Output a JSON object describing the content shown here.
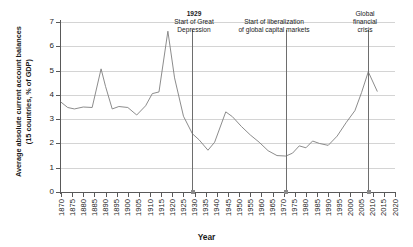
{
  "chart_data": {
    "type": "line",
    "title": "",
    "xlabel": "Year",
    "ylabel": "Average absolute current account balances (15 countries, % of GDP)",
    "ylabel_line1": "Average absolute current account balances",
    "ylabel_line2": "(15 countries, % of GDP)",
    "xlim": [
      1870,
      2020
    ],
    "ylim": [
      0,
      7
    ],
    "ytick_step": 1,
    "xtick_step": 5,
    "grid": true,
    "legend": "none",
    "line_color": "#7f7f7f",
    "grid_color": "#d4d4d4",
    "axis_color": "#595959",
    "yticks": [
      "0",
      "1",
      "2",
      "3",
      "4",
      "5",
      "6",
      "7"
    ],
    "xticks": [
      "1870",
      "1875",
      "1880",
      "1885",
      "1890",
      "1895",
      "1900",
      "1905",
      "1910",
      "1915",
      "1920",
      "1925",
      "1930",
      "1935",
      "1940",
      "1945",
      "1950",
      "1955",
      "1960",
      "1965",
      "1970",
      "1975",
      "1980",
      "1985",
      "1990",
      "1995",
      "2000",
      "2005",
      "2010",
      "2015",
      "2020"
    ],
    "x": [
      1870,
      1873,
      1876,
      1880,
      1884,
      1888,
      1890,
      1893,
      1896,
      1900,
      1904,
      1908,
      1911,
      1914,
      1918,
      1921,
      1925,
      1929,
      1932,
      1936,
      1939,
      1944,
      1947,
      1951,
      1955,
      1959,
      1963,
      1967,
      1971,
      1974,
      1977,
      1980,
      1983,
      1986,
      1990,
      1994,
      1998,
      2002,
      2005,
      2008,
      2012
    ],
    "values": [
      3.7,
      3.48,
      3.42,
      3.5,
      3.48,
      5.07,
      4.35,
      3.42,
      3.52,
      3.48,
      3.17,
      3.55,
      4.05,
      4.12,
      6.62,
      4.7,
      3.12,
      2.4,
      2.15,
      1.72,
      2.05,
      3.3,
      3.1,
      2.7,
      2.35,
      2.05,
      1.7,
      1.5,
      1.48,
      1.6,
      1.9,
      1.82,
      2.1,
      2.0,
      1.92,
      2.3,
      2.85,
      3.35,
      4.1,
      4.95,
      4.15
    ],
    "annotations": [
      {
        "id": "1929",
        "x_value": 1929,
        "header": "1929",
        "line1": "Start of Great",
        "line2": "Depression"
      },
      {
        "id": "liberalization",
        "x_value": 1971,
        "header": "",
        "line1": "Start of liberalization",
        "line2": "of global capital markets"
      },
      {
        "id": "gfc",
        "x_value": 2008,
        "header": "",
        "line1": "Global",
        "line2": "financial",
        "line3": "crisis"
      }
    ]
  }
}
